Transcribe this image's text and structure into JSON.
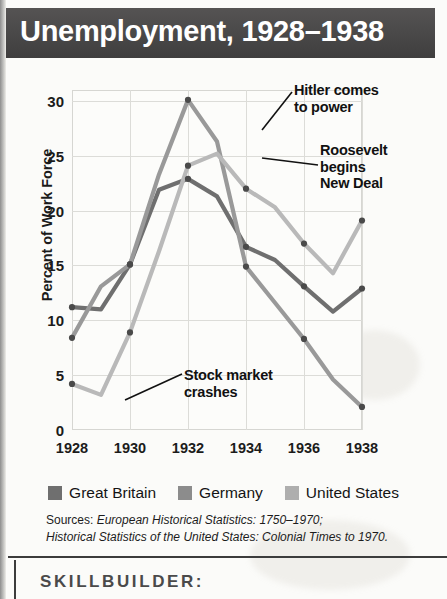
{
  "header": {
    "title": "Unemployment, 1928–1938"
  },
  "chart_data": {
    "type": "line",
    "title": "Unemployment, 1928–1938",
    "xlabel": "",
    "ylabel": "Percent of Work Force",
    "x": [
      1928,
      1929,
      1930,
      1931,
      1932,
      1933,
      1934,
      1935,
      1936,
      1937,
      1938
    ],
    "xtick_labels": [
      "1928",
      "1930",
      "1932",
      "1934",
      "1936",
      "1938"
    ],
    "xtick_values": [
      1928,
      1930,
      1932,
      1934,
      1936,
      1938
    ],
    "ytick_labels": [
      "0",
      "5",
      "10",
      "15",
      "20",
      "25",
      "30"
    ],
    "ytick_values": [
      0,
      5,
      10,
      15,
      20,
      25,
      30
    ],
    "xlim": [
      1928,
      1938
    ],
    "ylim": [
      0,
      31
    ],
    "grid": true,
    "legend_position": "bottom",
    "series": [
      {
        "name": "Great Britain",
        "color": "#6f6f6f",
        "values": [
          11.2,
          11.0,
          15.1,
          21.9,
          22.9,
          21.3,
          16.7,
          15.5,
          13.1,
          10.8,
          12.9
        ]
      },
      {
        "name": "Germany",
        "color": "#999999",
        "values": [
          8.4,
          13.1,
          15.1,
          23.3,
          30.1,
          26.3,
          14.9,
          11.6,
          8.3,
          4.6,
          2.1
        ]
      },
      {
        "name": "United States",
        "color": "#b9b9b9",
        "values": [
          4.2,
          3.2,
          8.9,
          16.3,
          24.1,
          25.2,
          22.0,
          20.3,
          17.0,
          14.3,
          19.1
        ]
      }
    ],
    "annotations": [
      {
        "id": "hitler",
        "text": "Hitler comes to power",
        "points_to_year": 1933
      },
      {
        "id": "roosevelt",
        "text": "Roosevelt begins New Deal",
        "points_to_year": 1933
      },
      {
        "id": "crash",
        "text": "Stock market crashes",
        "points_to_year": 1929
      }
    ]
  },
  "annotations": {
    "hitler_line1": "Hitler comes",
    "hitler_line2": "to power",
    "roosevelt_line1": "Roosevelt",
    "roosevelt_line2": "begins",
    "roosevelt_line3": "New Deal",
    "crash_line1": "Stock market",
    "crash_line2": "crashes"
  },
  "legend": {
    "items": [
      {
        "label": "Great Britain",
        "color": "#6f6f6f"
      },
      {
        "label": "Germany",
        "color": "#8c8c8c"
      },
      {
        "label": "United States",
        "color": "#aeaeae"
      }
    ]
  },
  "sources": {
    "lead": "Sources:",
    "line1_italic": " European Historical Statistics: 1750–1970;",
    "line2_italic": "Historical Statistics of the United States: Colonial Times to 1970."
  },
  "skillbuilder": {
    "label": "SKILLBUILDER:"
  }
}
